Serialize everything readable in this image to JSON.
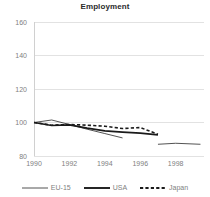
{
  "chart_data": {
    "type": "line",
    "title": "Employment",
    "xlabel": "",
    "ylabel": "",
    "xlim": [
      1990,
      1999.6
    ],
    "ylim": [
      80,
      160
    ],
    "grid": true,
    "legend_position": "bottom",
    "x_ticks": [
      1990,
      1992,
      1994,
      1996,
      1998
    ],
    "x_tick_labels": [
      "1990",
      "1992",
      "1994",
      "1996",
      "1998"
    ],
    "y_ticks": [
      80,
      100,
      120,
      140,
      160
    ],
    "y_tick_labels": [
      "80",
      "100",
      "120",
      "140",
      "160"
    ],
    "series": [
      {
        "name": "EU-15",
        "style": "thin-solid",
        "color": "#3f3f3f",
        "x": [
          1990,
          1991,
          1992,
          1993,
          1994,
          1995
        ],
        "values": [
          100,
          101.5,
          98.8,
          96.0,
          93.4,
          90.8
        ]
      },
      {
        "name": "USA",
        "style": "thick-solid",
        "color": "#1a1a1a",
        "x": [
          1990,
          1991,
          1992,
          1993,
          1994,
          1995,
          1996,
          1997
        ],
        "values": [
          100,
          98.2,
          98.6,
          96.6,
          95.0,
          94.2,
          93.6,
          92.6
        ]
      },
      {
        "name": "Japan",
        "style": "dotted",
        "color": "#1a1a1a",
        "x": [
          1990,
          1991,
          1992,
          1993,
          1994,
          1995,
          1996,
          1997
        ],
        "values": [
          100,
          98.4,
          98.8,
          98.4,
          97.8,
          96.4,
          97.0,
          93.0
        ]
      },
      {
        "name": "EU-15",
        "style": "thin-solid",
        "color": "#3f3f3f",
        "x": [
          1997,
          1998,
          1999.4
        ],
        "values": [
          87.0,
          87.6,
          87.0
        ]
      }
    ]
  },
  "legend": {
    "items": [
      {
        "label": "EU-15",
        "marker": "thin-solid-line-swatch"
      },
      {
        "label": "USA",
        "marker": "thick-solid-line-swatch"
      },
      {
        "label": "Japan",
        "marker": "dotted-line-swatch"
      }
    ]
  },
  "colors": {
    "gridline": "#e2e2e2",
    "axis": "#d0d0d0",
    "tick_text": "#808080",
    "title_text": "#2b2b2b",
    "plot_background": "#ffffff"
  }
}
